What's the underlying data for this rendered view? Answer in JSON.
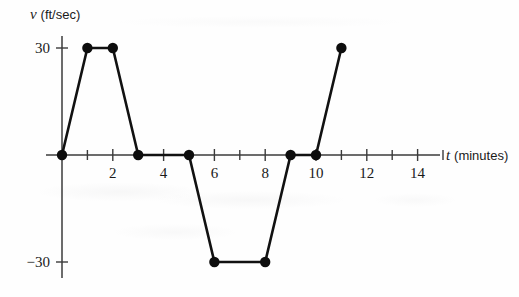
{
  "figure": {
    "background_color": "#fefefe",
    "ink_color": "#111111",
    "axis_color": "#3b3b3b"
  },
  "axes": {
    "y": {
      "variable": "v",
      "unit": "(ft/sec)",
      "tick_labels": [
        "30",
        "−30"
      ],
      "tick_values": [
        30,
        -30
      ]
    },
    "x": {
      "variable": "t",
      "unit": "(minutes)",
      "tick_labels": [
        "2",
        "4",
        "6",
        "8",
        "10",
        "12",
        "14"
      ],
      "tick_values": [
        2,
        4,
        6,
        8,
        10,
        12,
        14
      ],
      "minor_tick_values": [
        1,
        3,
        5,
        7,
        9,
        11,
        13,
        15
      ]
    }
  },
  "chart_data": {
    "type": "line",
    "title": "",
    "xlabel": "t (minutes)",
    "ylabel": "v (ft/sec)",
    "xlim": [
      0,
      15.5
    ],
    "ylim": [
      -38,
      38
    ],
    "xticks": [
      2,
      4,
      6,
      8,
      10,
      12,
      14
    ],
    "yticks": [
      30,
      -30
    ],
    "grid": false,
    "legend": false,
    "markers": "filled-circle",
    "series": [
      {
        "name": "velocity",
        "x": [
          0,
          1,
          2,
          3,
          5,
          6,
          8,
          9,
          10,
          11
        ],
        "y": [
          0,
          30,
          30,
          0,
          0,
          -30,
          -30,
          0,
          0,
          30
        ],
        "points": [
          {
            "t": 0,
            "v": 0
          },
          {
            "t": 1,
            "v": 30
          },
          {
            "t": 2,
            "v": 30
          },
          {
            "t": 3,
            "v": 0
          },
          {
            "t": 5,
            "v": 0
          },
          {
            "t": 6,
            "v": -30
          },
          {
            "t": 8,
            "v": -30
          },
          {
            "t": 9,
            "v": 0
          },
          {
            "t": 10,
            "v": 0
          },
          {
            "t": 11,
            "v": 30
          }
        ]
      }
    ]
  }
}
